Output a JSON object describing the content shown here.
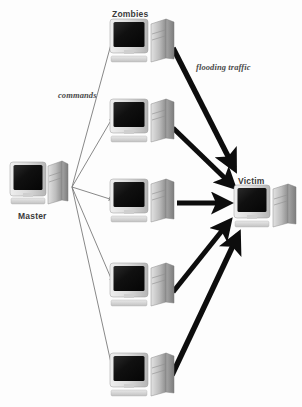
{
  "figure": {
    "background_color": "#fdfdfd"
  },
  "labels": {
    "master": "Master",
    "zombies": "Zombies",
    "victim": "Victim",
    "commands": "commands",
    "flooding_traffic": "flooding traffic"
  },
  "colors": {
    "flooding_arrow": "#0d0d0d",
    "command_arrow": "#7a7a7a",
    "monitor_screen": "#151515",
    "case_light": "#d9d9d9",
    "case_mid": "#b4b4b4",
    "case_dark": "#8f8f8f",
    "label_text": "#3a3a3a"
  },
  "nodes": {
    "master": {
      "name": "Master",
      "x": 10,
      "y": 160,
      "w": 58,
      "h": 50,
      "label_x": 18,
      "label_y": 211
    },
    "victim": {
      "name": "Victim",
      "x": 234,
      "y": 184,
      "w": 62,
      "h": 48,
      "label_x": 238,
      "label_y": 177
    },
    "zombies": [
      {
        "name": "Zombie 1",
        "x": 110,
        "y": 18,
        "w": 66,
        "h": 48
      },
      {
        "name": "Zombie 2",
        "x": 110,
        "y": 98,
        "w": 66,
        "h": 48
      },
      {
        "name": "Zombie 3",
        "x": 110,
        "y": 178,
        "w": 66,
        "h": 48
      },
      {
        "name": "Zombie 4",
        "x": 110,
        "y": 262,
        "w": 66,
        "h": 48
      },
      {
        "name": "Zombie 5",
        "x": 110,
        "y": 352,
        "w": 66,
        "h": 48
      }
    ],
    "zombies_label": {
      "x": 112,
      "y": 9
    }
  },
  "edges": {
    "commands": {
      "label": "commands",
      "label_x": 58,
      "label_y": 90,
      "style": "thin-gray-arrow",
      "origin": {
        "x": 72,
        "y": 187
      },
      "targets": [
        {
          "x": 113,
          "y": 37
        },
        {
          "x": 113,
          "y": 117
        },
        {
          "x": 113,
          "y": 200
        },
        {
          "x": 113,
          "y": 283
        },
        {
          "x": 113,
          "y": 372
        }
      ]
    },
    "flooding": {
      "label": "flooding traffic",
      "label_x": 196,
      "label_y": 63,
      "style": "thick-black-arrow",
      "target": {
        "x": 240,
        "y": 202
      },
      "sources": [
        {
          "x": 172,
          "y": 50
        },
        {
          "x": 172,
          "y": 128
        },
        {
          "x": 176,
          "y": 203
        },
        {
          "x": 172,
          "y": 292
        },
        {
          "x": 172,
          "y": 375
        }
      ]
    }
  }
}
